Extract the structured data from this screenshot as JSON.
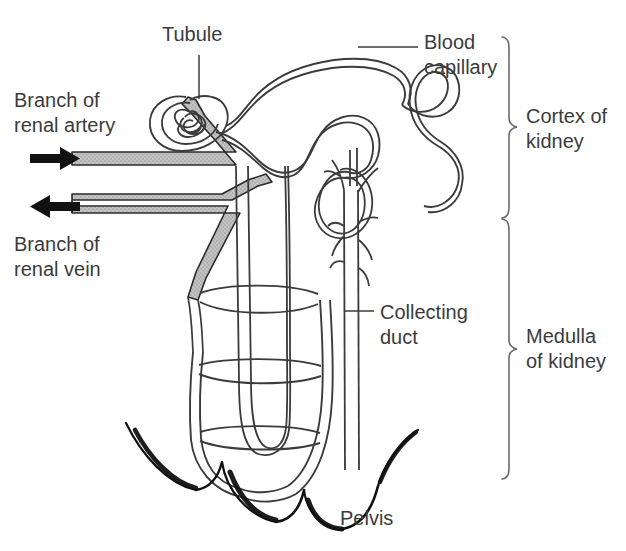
{
  "diagram": {
    "labels": {
      "tubule": "Tubule",
      "branch_renal_artery": "Branch of\nrenal artery",
      "branch_renal_vein": "Branch of\nrenal vein",
      "blood_capillary": "Blood\ncapillary",
      "cortex_of_kidney": "Cortex of\nkidney",
      "collecting_duct": "Collecting\nduct",
      "medulla_of_kidney": "Medulla\nof kidney",
      "pelvis": "Pelvis"
    },
    "colors": {
      "background": "#ffffff",
      "text": "#3b3b3d",
      "outline": "#3b3b3d",
      "vessel_fill": "#bfbfbf",
      "vessel_stroke": "#2b2b2b",
      "arrow": "#111111",
      "brace": "#5a5a5c",
      "pelvis_stroke": "#111111"
    },
    "structures": [
      {
        "name": "glomerulus",
        "note": "tight coiled capillary knot inside Bowman's capsule"
      },
      {
        "name": "bowmans-capsule",
        "note": "cup enclosing the glomerulus at upper left of cortex"
      },
      {
        "name": "proximal-convoluted-tubule",
        "note": "looping tubule in the cortex"
      },
      {
        "name": "distal-convoluted-tubule",
        "note": "looping tubule returning toward collecting duct"
      },
      {
        "name": "loop-of-henle",
        "note": "long descending and ascending limbs reaching into the medulla"
      },
      {
        "name": "vasa-recta",
        "note": "ladder-like capillary network around the loop of Henle"
      },
      {
        "name": "collecting-duct",
        "note": "vertical duct draining toward the pelvis"
      },
      {
        "name": "renal-pelvis",
        "note": "scalloped dark boundary at the base of the medulla"
      }
    ],
    "arrows": [
      {
        "name": "artery-inflow-arrow",
        "direction": "right",
        "meaning": "blood flowing into the kidney"
      },
      {
        "name": "vein-outflow-arrow",
        "direction": "left",
        "meaning": "blood flowing out of the kidney"
      }
    ],
    "braces": [
      {
        "name": "cortex-brace",
        "label_key": "cortex_of_kidney"
      },
      {
        "name": "medulla-brace",
        "label_key": "medulla_of_kidney"
      }
    ]
  }
}
